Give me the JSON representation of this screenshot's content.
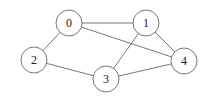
{
  "graph": {
    "type": "undirected",
    "node_radius": 13,
    "colors": {
      "stroke": "#555555",
      "fill": "#ffffff",
      "text": "#222222"
    },
    "nodes": [
      {
        "id": "0",
        "label": "0",
        "x": 69,
        "y": 23
      },
      {
        "id": "1",
        "label": "1",
        "x": 146,
        "y": 23
      },
      {
        "id": "2",
        "label": "2",
        "x": 34,
        "y": 60
      },
      {
        "id": "3",
        "label": "3",
        "x": 106,
        "y": 79
      },
      {
        "id": "4",
        "label": "4",
        "x": 184,
        "y": 61
      }
    ],
    "edges": [
      {
        "from": "0",
        "to": "1"
      },
      {
        "from": "0",
        "to": "2"
      },
      {
        "from": "0",
        "to": "4"
      },
      {
        "from": "1",
        "to": "3"
      },
      {
        "from": "1",
        "to": "4"
      },
      {
        "from": "2",
        "to": "3"
      },
      {
        "from": "3",
        "to": "4"
      }
    ]
  }
}
